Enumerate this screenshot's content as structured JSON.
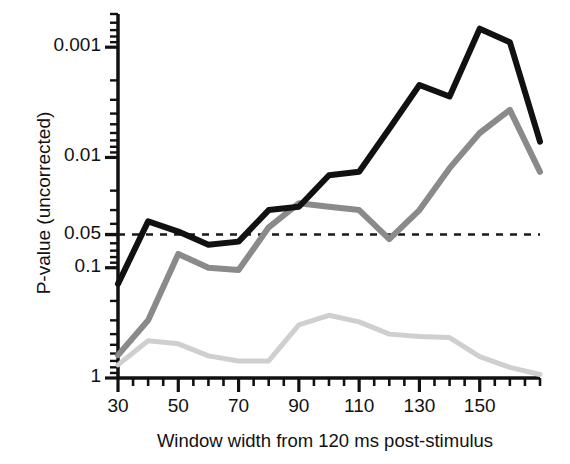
{
  "chart_data": {
    "type": "line",
    "title": "",
    "xlabel": "Window width from 120 ms post-stimulus",
    "ylabel": "P-value (uncorrected)",
    "x": [
      30,
      40,
      50,
      60,
      70,
      80,
      90,
      100,
      110,
      120,
      130,
      140,
      150,
      160,
      170
    ],
    "xlim": [
      30,
      170
    ],
    "ylim": [
      1,
      0.0005
    ],
    "yscale": "log-inverted",
    "xticks_major": [
      30,
      50,
      70,
      90,
      110,
      130,
      150
    ],
    "xticks_major_labels": [
      "30",
      "50",
      "70",
      "90",
      "110",
      "130",
      "150"
    ],
    "xtick_minor_step": 5,
    "yticks_labeled": [
      {
        "value": 0.001,
        "label": "0.001"
      },
      {
        "value": 0.01,
        "label": "0.01"
      },
      {
        "value": 0.05,
        "label": "0.05"
      },
      {
        "value": 0.1,
        "label": "0.1"
      },
      {
        "value": 1,
        "label": "1"
      }
    ],
    "grid": false,
    "legend": "none",
    "threshold_line": {
      "value": 0.05,
      "style": "dashed",
      "color": "#1a1a1a",
      "label": ""
    },
    "series": [
      {
        "name": "black-curve",
        "color": "#111111",
        "width": 6,
        "values": [
          0.14,
          0.038,
          0.047,
          0.062,
          0.058,
          0.03,
          0.028,
          0.0145,
          0.0135,
          0.0055,
          0.0022,
          0.0028,
          0.00068,
          0.0009,
          0.0072
        ]
      },
      {
        "name": "mid-gray-curve",
        "color": "#8a8a8a",
        "width": 6,
        "values": [
          0.62,
          0.3,
          0.075,
          0.1,
          0.105,
          0.043,
          0.026,
          0.028,
          0.03,
          0.055,
          0.03,
          0.0125,
          0.006,
          0.0037,
          0.0135
        ]
      },
      {
        "name": "light-gray-curve",
        "color": "#cfcfcf",
        "width": 5,
        "values": [
          0.76,
          0.46,
          0.49,
          0.63,
          0.7,
          0.7,
          0.33,
          0.27,
          0.31,
          0.4,
          0.42,
          0.43,
          0.64,
          0.8,
          0.93
        ]
      }
    ]
  },
  "axis": {
    "frame_color": "#111111",
    "background": "#ffffff"
  }
}
